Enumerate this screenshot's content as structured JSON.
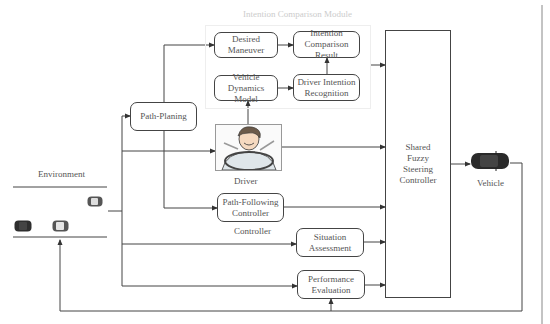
{
  "diagram": {
    "module": {
      "title": "Intention Comparison Module"
    },
    "nodes": {
      "desired_maneuver": "Desired Maneuver",
      "intention_comparison_result": "Intention Comparison Result",
      "vehicle_dynamics_model": "Vehicle Dynamics Model",
      "driver_intention_recognition": "Driver Intention Recognition",
      "path_planing": "Path-Planing",
      "path_following_controller": "Path-Following Controller",
      "situation_assessment": "Situation Assessment",
      "performance_evaluation": "Performance Evaluation",
      "shared_fuzzy_steering_controller": "Shared Fuzzy Steering Controller"
    },
    "labels": {
      "environment": "Environment",
      "driver": "Driver",
      "controller": "Controller",
      "vehicle": "Vehicle"
    },
    "icons": {
      "driver": "driver-at-wheel-illustration",
      "vehicle": "car-top-view",
      "environment_cars": [
        "car-top-view",
        "car-top-view",
        "car-top-view"
      ]
    },
    "edges": [
      [
        "Environment",
        "Path-Planing"
      ],
      [
        "Environment",
        "Driver"
      ],
      [
        "Environment",
        "Situation Assessment"
      ],
      [
        "Environment",
        "Performance Evaluation"
      ],
      [
        "Path-Planing",
        "Desired Maneuver"
      ],
      [
        "Path-Planing",
        "Path-Following Controller"
      ],
      [
        "Desired Maneuver",
        "Intention Comparison Result"
      ],
      [
        "Vehicle Dynamics Model",
        "Driver Intention Recognition"
      ],
      [
        "Driver Intention Recognition",
        "Intention Comparison Result"
      ],
      [
        "Driver",
        "Vehicle Dynamics Model"
      ],
      [
        "Intention Comparison Result",
        "Shared Fuzzy Steering Controller"
      ],
      [
        "Driver",
        "Shared Fuzzy Steering Controller"
      ],
      [
        "Path-Following Controller",
        "Shared Fuzzy Steering Controller"
      ],
      [
        "Situation Assessment",
        "Shared Fuzzy Steering Controller"
      ],
      [
        "Performance Evaluation",
        "Shared Fuzzy Steering Controller"
      ],
      [
        "Shared Fuzzy Steering Controller",
        "Vehicle"
      ],
      [
        "Vehicle",
        "Performance Evaluation"
      ],
      [
        "Vehicle",
        "Environment"
      ]
    ],
    "colors": {
      "line": "#444444",
      "text": "#555555",
      "module_title": "#cccccc"
    }
  }
}
